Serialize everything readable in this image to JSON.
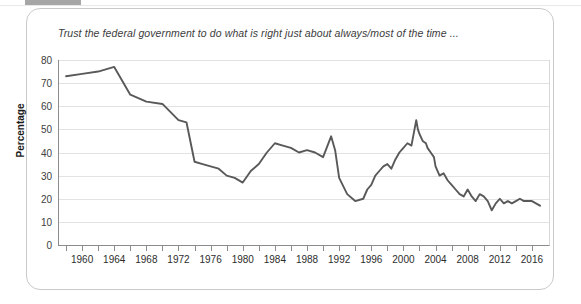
{
  "window": {
    "top_bar_label": ""
  },
  "axis": {
    "y_title": "Percentage",
    "y_ticks": [
      0,
      10,
      20,
      30,
      40,
      50,
      60,
      70,
      80
    ],
    "x_ticks_labeled": [
      1960,
      1964,
      1968,
      1972,
      1976,
      1980,
      1984,
      1988,
      1992,
      1996,
      2000,
      2004,
      2008,
      2012,
      2016
    ]
  },
  "style": {
    "line_color": "#595959",
    "grid_color": "#e2e2e2",
    "axis_color": "#8c8c8c",
    "card_border": "#c9c9c9",
    "top_bar_color": "#a6a6a6"
  },
  "chart_data": {
    "type": "line",
    "title": "Trust the federal government to do what is right just about always/most of the time ...",
    "xlabel": "",
    "ylabel": "Percentage",
    "xlim": [
      1957,
      2018
    ],
    "ylim": [
      0,
      80
    ],
    "grid": "horizontal",
    "legend": "none",
    "series": [
      {
        "name": "Trust the federal government to do what is right just about always/most of the time",
        "x": [
          1958,
          1960,
          1962,
          1964,
          1966,
          1968,
          1970,
          1972,
          1973,
          1974,
          1975,
          1976,
          1977,
          1978,
          1979,
          1980,
          1981,
          1982,
          1983,
          1984,
          1985,
          1986,
          1987,
          1988,
          1989,
          1990,
          1991,
          1991.5,
          1992,
          1993,
          1994,
          1995,
          1995.5,
          1996,
          1996.5,
          1997,
          1997.5,
          1998,
          1998.5,
          1999,
          1999.5,
          2000,
          2000.5,
          2001,
          2001.6,
          2001.8,
          2002,
          2002.4,
          2002.8,
          2003,
          2003.4,
          2003.8,
          2004,
          2004.5,
          2005,
          2005.5,
          2006,
          2006.5,
          2007,
          2007.5,
          2008,
          2008.5,
          2009,
          2009.5,
          2010,
          2010.5,
          2011,
          2011.5,
          2012,
          2012.5,
          2013,
          2013.5,
          2014,
          2014.5,
          2015,
          2016,
          2016.5,
          2017
        ],
        "y": [
          73,
          74,
          75,
          77,
          65,
          62,
          61,
          54,
          53,
          36,
          35,
          34,
          33,
          30,
          29,
          27,
          32,
          35,
          40,
          44,
          43,
          42,
          40,
          41,
          40,
          38,
          47,
          41,
          29,
          22,
          19,
          20,
          24,
          26,
          30,
          32,
          34,
          35,
          33,
          37,
          40,
          42,
          44,
          43,
          54,
          50,
          48,
          45,
          44,
          42,
          40,
          38,
          34,
          30,
          31,
          28,
          26,
          24,
          22,
          21,
          24,
          21,
          19,
          22,
          21,
          19,
          15,
          18,
          20,
          18,
          19,
          18,
          19,
          20,
          19,
          19,
          18,
          17
        ]
      }
    ]
  }
}
